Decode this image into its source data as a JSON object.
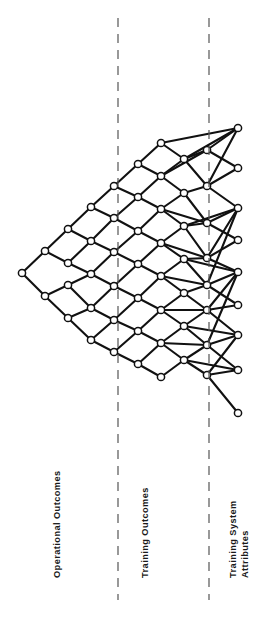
{
  "figure": {
    "background_color": "#ffffff",
    "stroke_color": "#111111",
    "node_fill_color": "#ffffff",
    "divider_color": "#555555",
    "width": 256,
    "height": 620
  },
  "zones": [
    {
      "id": "operational-outcomes",
      "label": "Operational Outcomes",
      "lines": [
        "Operational Outcomes"
      ],
      "x_range": [
        0,
        118
      ]
    },
    {
      "id": "training-outcomes",
      "label": "Training Outcomes",
      "lines": [
        "Training Outcomes"
      ],
      "x_range": [
        118,
        209
      ]
    },
    {
      "id": "training-system-attributes",
      "label": "Training System Attributes",
      "lines": [
        "Training System",
        "Attributes"
      ],
      "x_range": [
        209,
        256
      ]
    }
  ],
  "dividers": [
    {
      "id": "divider-1",
      "x": 118,
      "y_start": 18,
      "y_end": 600,
      "style": "dashed"
    },
    {
      "id": "divider-2",
      "x": 209,
      "y_start": 18,
      "y_end": 600,
      "style": "dashed"
    }
  ],
  "chart_data": {
    "type": "scatter",
    "xlabel": "",
    "ylabel": "",
    "layout": "left-apex diamond lattice fanning right",
    "node_radius": 3.6,
    "edge_width": 2.1,
    "columns_x": [
      22,
      45,
      68,
      91,
      114,
      138,
      161,
      184,
      207,
      238
    ],
    "nodes": [
      {
        "id": "n0",
        "col": 0,
        "x": 22,
        "y": 273
      },
      {
        "id": "n1",
        "col": 1,
        "x": 45,
        "y": 251
      },
      {
        "id": "n2",
        "col": 1,
        "x": 45,
        "y": 296
      },
      {
        "id": "n3",
        "col": 2,
        "x": 68,
        "y": 229
      },
      {
        "id": "n4",
        "col": 2,
        "x": 68,
        "y": 263
      },
      {
        "id": "n5",
        "col": 2,
        "x": 68,
        "y": 285
      },
      {
        "id": "n6",
        "col": 2,
        "x": 68,
        "y": 318
      },
      {
        "id": "n7",
        "col": 3,
        "x": 91,
        "y": 207
      },
      {
        "id": "n8",
        "col": 3,
        "x": 91,
        "y": 241
      },
      {
        "id": "n9",
        "col": 3,
        "x": 91,
        "y": 274
      },
      {
        "id": "n10",
        "col": 3,
        "x": 91,
        "y": 308
      },
      {
        "id": "n11",
        "col": 3,
        "x": 91,
        "y": 340
      },
      {
        "id": "n12",
        "col": 4,
        "x": 114,
        "y": 186
      },
      {
        "id": "n13",
        "col": 4,
        "x": 114,
        "y": 218
      },
      {
        "id": "n14",
        "col": 4,
        "x": 114,
        "y": 252
      },
      {
        "id": "n15",
        "col": 4,
        "x": 114,
        "y": 286
      },
      {
        "id": "n16",
        "col": 4,
        "x": 114,
        "y": 320
      },
      {
        "id": "n17",
        "col": 4,
        "x": 114,
        "y": 352
      },
      {
        "id": "n18",
        "col": 5,
        "x": 138,
        "y": 164
      },
      {
        "id": "n19",
        "col": 5,
        "x": 138,
        "y": 197
      },
      {
        "id": "n20",
        "col": 5,
        "x": 138,
        "y": 231
      },
      {
        "id": "n21",
        "col": 5,
        "x": 138,
        "y": 264
      },
      {
        "id": "n22",
        "col": 5,
        "x": 138,
        "y": 298
      },
      {
        "id": "n23",
        "col": 5,
        "x": 138,
        "y": 331
      },
      {
        "id": "n24",
        "col": 5,
        "x": 138,
        "y": 364
      },
      {
        "id": "n25",
        "col": 6,
        "x": 161,
        "y": 143
      },
      {
        "id": "n26",
        "col": 6,
        "x": 161,
        "y": 176
      },
      {
        "id": "n27",
        "col": 6,
        "x": 161,
        "y": 209
      },
      {
        "id": "n28",
        "col": 6,
        "x": 161,
        "y": 243
      },
      {
        "id": "n29",
        "col": 6,
        "x": 161,
        "y": 276
      },
      {
        "id": "n30",
        "col": 6,
        "x": 161,
        "y": 310
      },
      {
        "id": "n31",
        "col": 6,
        "x": 161,
        "y": 343
      },
      {
        "id": "n32",
        "col": 6,
        "x": 161,
        "y": 377
      },
      {
        "id": "n33",
        "col": 7,
        "x": 184,
        "y": 159
      },
      {
        "id": "n34",
        "col": 7,
        "x": 184,
        "y": 193
      },
      {
        "id": "n35",
        "col": 7,
        "x": 184,
        "y": 226
      },
      {
        "id": "n36",
        "col": 7,
        "x": 184,
        "y": 259
      },
      {
        "id": "n37",
        "col": 7,
        "x": 184,
        "y": 293
      },
      {
        "id": "n38",
        "col": 7,
        "x": 184,
        "y": 326
      },
      {
        "id": "n39",
        "col": 7,
        "x": 184,
        "y": 360
      },
      {
        "id": "n40",
        "col": 8,
        "x": 207,
        "y": 150
      },
      {
        "id": "n41",
        "col": 8,
        "x": 207,
        "y": 186
      },
      {
        "id": "n42",
        "col": 8,
        "x": 207,
        "y": 223
      },
      {
        "id": "n43",
        "col": 8,
        "x": 207,
        "y": 258
      },
      {
        "id": "n44",
        "col": 8,
        "x": 207,
        "y": 285
      },
      {
        "id": "n45",
        "col": 8,
        "x": 207,
        "y": 310
      },
      {
        "id": "n46",
        "col": 8,
        "x": 207,
        "y": 345
      },
      {
        "id": "n47",
        "col": 8,
        "x": 207,
        "y": 375
      },
      {
        "id": "n48",
        "col": 9,
        "x": 238,
        "y": 128
      },
      {
        "id": "n49",
        "col": 9,
        "x": 238,
        "y": 168
      },
      {
        "id": "n50",
        "col": 9,
        "x": 238,
        "y": 208
      },
      {
        "id": "n51",
        "col": 9,
        "x": 238,
        "y": 240
      },
      {
        "id": "n52",
        "col": 9,
        "x": 238,
        "y": 272
      },
      {
        "id": "n53",
        "col": 9,
        "x": 238,
        "y": 305
      },
      {
        "id": "n54",
        "col": 9,
        "x": 238,
        "y": 335
      },
      {
        "id": "n55",
        "col": 9,
        "x": 238,
        "y": 370
      },
      {
        "id": "n56",
        "col": 9,
        "x": 238,
        "y": 413
      }
    ],
    "edges": [
      [
        "n0",
        "n1"
      ],
      [
        "n0",
        "n2"
      ],
      [
        "n1",
        "n3"
      ],
      [
        "n1",
        "n4"
      ],
      [
        "n2",
        "n5"
      ],
      [
        "n2",
        "n6"
      ],
      [
        "n3",
        "n7"
      ],
      [
        "n3",
        "n8"
      ],
      [
        "n4",
        "n8"
      ],
      [
        "n4",
        "n9"
      ],
      [
        "n5",
        "n9"
      ],
      [
        "n5",
        "n10"
      ],
      [
        "n6",
        "n10"
      ],
      [
        "n6",
        "n11"
      ],
      [
        "n7",
        "n12"
      ],
      [
        "n7",
        "n13"
      ],
      [
        "n8",
        "n13"
      ],
      [
        "n8",
        "n14"
      ],
      [
        "n9",
        "n14"
      ],
      [
        "n9",
        "n15"
      ],
      [
        "n10",
        "n15"
      ],
      [
        "n10",
        "n16"
      ],
      [
        "n11",
        "n16"
      ],
      [
        "n11",
        "n17"
      ],
      [
        "n12",
        "n18"
      ],
      [
        "n12",
        "n19"
      ],
      [
        "n13",
        "n19"
      ],
      [
        "n13",
        "n20"
      ],
      [
        "n14",
        "n20"
      ],
      [
        "n14",
        "n21"
      ],
      [
        "n15",
        "n21"
      ],
      [
        "n15",
        "n22"
      ],
      [
        "n16",
        "n22"
      ],
      [
        "n16",
        "n23"
      ],
      [
        "n17",
        "n23"
      ],
      [
        "n17",
        "n24"
      ],
      [
        "n18",
        "n25"
      ],
      [
        "n18",
        "n26"
      ],
      [
        "n19",
        "n26"
      ],
      [
        "n19",
        "n27"
      ],
      [
        "n20",
        "n27"
      ],
      [
        "n20",
        "n28"
      ],
      [
        "n21",
        "n28"
      ],
      [
        "n21",
        "n29"
      ],
      [
        "n22",
        "n29"
      ],
      [
        "n22",
        "n30"
      ],
      [
        "n23",
        "n30"
      ],
      [
        "n23",
        "n31"
      ],
      [
        "n24",
        "n31"
      ],
      [
        "n24",
        "n32"
      ],
      [
        "n25",
        "n48"
      ],
      [
        "n25",
        "n33"
      ],
      [
        "n26",
        "n33"
      ],
      [
        "n26",
        "n34"
      ],
      [
        "n27",
        "n34"
      ],
      [
        "n27",
        "n35"
      ],
      [
        "n28",
        "n35"
      ],
      [
        "n28",
        "n36"
      ],
      [
        "n29",
        "n36"
      ],
      [
        "n29",
        "n37"
      ],
      [
        "n30",
        "n37"
      ],
      [
        "n30",
        "n38"
      ],
      [
        "n31",
        "n38"
      ],
      [
        "n31",
        "n39"
      ],
      [
        "n32",
        "n39"
      ],
      [
        "n33",
        "n40"
      ],
      [
        "n33",
        "n41"
      ],
      [
        "n33",
        "n48"
      ],
      [
        "n34",
        "n41"
      ],
      [
        "n34",
        "n42"
      ],
      [
        "n35",
        "n42"
      ],
      [
        "n35",
        "n43"
      ],
      [
        "n36",
        "n43"
      ],
      [
        "n36",
        "n44"
      ],
      [
        "n37",
        "n44"
      ],
      [
        "n37",
        "n45"
      ],
      [
        "n38",
        "n45"
      ],
      [
        "n38",
        "n46"
      ],
      [
        "n39",
        "n46"
      ],
      [
        "n39",
        "n47"
      ],
      [
        "n40",
        "n48"
      ],
      [
        "n40",
        "n49"
      ],
      [
        "n41",
        "n49"
      ],
      [
        "n41",
        "n50"
      ],
      [
        "n42",
        "n50"
      ],
      [
        "n42",
        "n51"
      ],
      [
        "n43",
        "n51"
      ],
      [
        "n43",
        "n52"
      ],
      [
        "n44",
        "n52"
      ],
      [
        "n44",
        "n53"
      ],
      [
        "n45",
        "n53"
      ],
      [
        "n45",
        "n54"
      ],
      [
        "n46",
        "n54"
      ],
      [
        "n46",
        "n55"
      ],
      [
        "n47",
        "n55"
      ],
      [
        "n47",
        "n56"
      ],
      [
        "n27",
        "n42"
      ],
      [
        "n28",
        "n43"
      ],
      [
        "n35",
        "n50"
      ],
      [
        "n36",
        "n52"
      ],
      [
        "n44",
        "n50"
      ],
      [
        "n45",
        "n52"
      ],
      [
        "n46",
        "n52"
      ],
      [
        "n47",
        "n54"
      ],
      [
        "n38",
        "n54"
      ],
      [
        "n39",
        "n55"
      ],
      [
        "n43",
        "n50"
      ],
      [
        "n41",
        "n48"
      ],
      [
        "n26",
        "n40"
      ],
      [
        "n29",
        "n44"
      ],
      [
        "n30",
        "n45"
      ],
      [
        "n31",
        "n46"
      ]
    ]
  }
}
